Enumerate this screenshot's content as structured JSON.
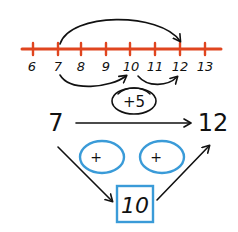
{
  "colors": {
    "number_line": "#e0451f",
    "ink": "#111111",
    "blue": "#3a9bd8",
    "background": "#ffffff"
  },
  "number_line": {
    "labels": [
      "6",
      "7",
      "8",
      "9",
      "10",
      "11",
      "12",
      "13"
    ],
    "jump_big": {
      "from": "7",
      "to": "12"
    },
    "jump_small_1": {
      "from": "7",
      "to": "10"
    },
    "jump_small_2": {
      "from": "10",
      "to": "12"
    }
  },
  "equation": {
    "start": "7",
    "end": "12",
    "operation": "+5"
  },
  "decomposition": {
    "left_bubble": "+",
    "right_bubble": "+",
    "middle_box": "10"
  }
}
